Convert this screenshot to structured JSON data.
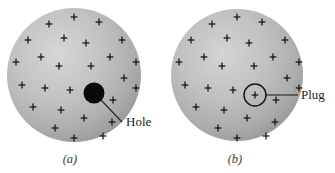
{
  "figure": {
    "background_color": "#ffffff",
    "sphere_fill_light": "#cfcfcf",
    "sphere_fill_mid": "#b4b4b4",
    "sphere_fill_dark": "#8e8e8e",
    "charge_color": "#141414",
    "hole_color": "#0a0a0a",
    "label_color": "#1a1a1a",
    "panels": [
      {
        "id": "a",
        "caption": "(a)",
        "caption_x": 70,
        "caption_y": 163,
        "sphere": {
          "cx": 74,
          "cy": 75,
          "r": 67
        },
        "feature": {
          "kind": "hole",
          "label": "Hole",
          "cx": 94,
          "cy": 93,
          "r": 10.5,
          "label_x": 126,
          "label_y": 126,
          "leader": {
            "x1": 101,
            "y1": 100,
            "x2": 122,
            "y2": 122
          }
        },
        "charges": [
          [
            74,
            17
          ],
          [
            49,
            24
          ],
          [
            99,
            22
          ],
          [
            28,
            40
          ],
          [
            64,
            38
          ],
          [
            122,
            40
          ],
          [
            86,
            43
          ],
          [
            16,
            62
          ],
          [
            41,
            57
          ],
          [
            110,
            57
          ],
          [
            136,
            62
          ],
          [
            59,
            66
          ],
          [
            91,
            66
          ],
          [
            22,
            85
          ],
          [
            45,
            88
          ],
          [
            124,
            78
          ],
          [
            70,
            90
          ],
          [
            136,
            88
          ],
          [
            33,
            107
          ],
          [
            61,
            110
          ],
          [
            113,
            100
          ],
          [
            112,
            122
          ],
          [
            84,
            118
          ],
          [
            55,
            128
          ],
          [
            103,
            136
          ],
          [
            74,
            138
          ],
          [
            29,
            70
          ],
          [
            99,
            85
          ]
        ]
      },
      {
        "id": "b",
        "caption": "(b)",
        "caption_x": 235,
        "caption_y": 163,
        "sphere": {
          "cx": 237,
          "cy": 75,
          "r": 66
        },
        "feature": {
          "kind": "plug",
          "label": "Plug",
          "cx": 255,
          "cy": 95,
          "r": 11,
          "label_x": 301,
          "label_y": 99,
          "leader": {
            "x1": 266,
            "y1": 95,
            "x2": 298,
            "y2": 95
          }
        },
        "charges": [
          [
            237,
            17
          ],
          [
            212,
            24
          ],
          [
            262,
            22
          ],
          [
            191,
            40
          ],
          [
            227,
            38
          ],
          [
            285,
            40
          ],
          [
            249,
            43
          ],
          [
            179,
            62
          ],
          [
            204,
            57
          ],
          [
            273,
            57
          ],
          [
            299,
            62
          ],
          [
            222,
            66
          ],
          [
            254,
            66
          ],
          [
            185,
            85
          ],
          [
            208,
            88
          ],
          [
            287,
            78
          ],
          [
            233,
            90
          ],
          [
            299,
            88
          ],
          [
            196,
            107
          ],
          [
            224,
            110
          ],
          [
            276,
            100
          ],
          [
            275,
            122
          ],
          [
            247,
            118
          ],
          [
            218,
            128
          ],
          [
            266,
            136
          ],
          [
            237,
            138
          ],
          [
            192,
            70
          ],
          [
            255,
            95
          ]
        ]
      }
    ]
  }
}
